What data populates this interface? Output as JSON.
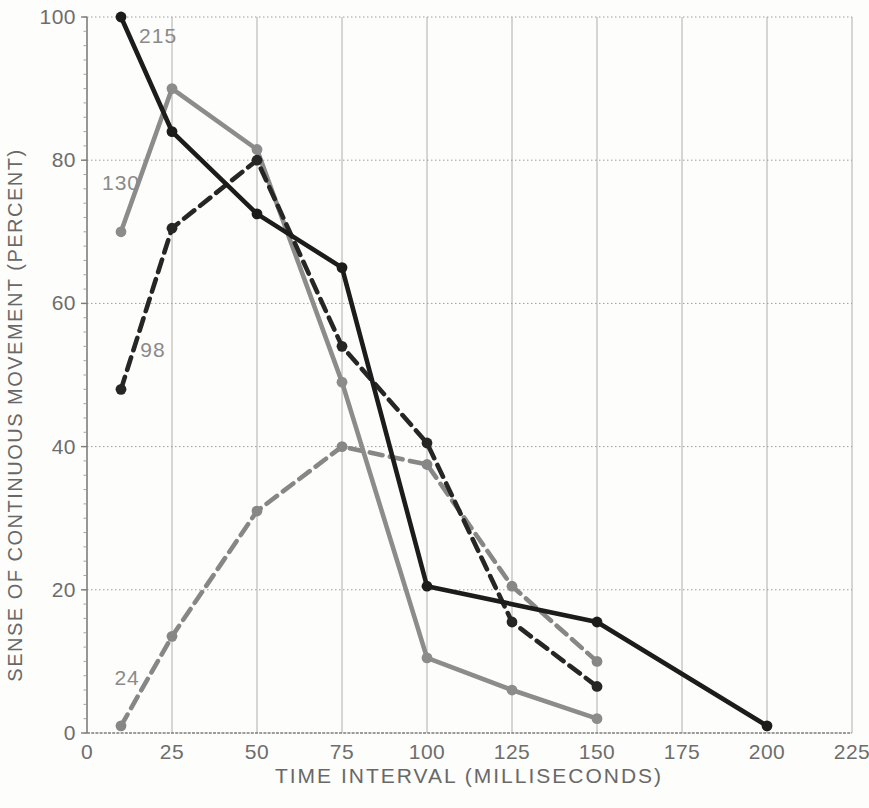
{
  "figure": {
    "background_color": "#fdfdfb",
    "axis_color": "#7d7d7d",
    "grid_vertical_color": "#aeaeae",
    "grid_horizontal_color": "#9c9c9c",
    "tick_label_color": "#6d6d6d",
    "title_color": "#686868",
    "series_label_color": "#8a8a8a"
  },
  "chart_data": {
    "type": "line",
    "title": "",
    "xlabel": "TIME INTERVAL (MILLISECONDS)",
    "ylabel": "SENSE OF CONTINUOUS MOVEMENT (PERCENT)",
    "xlim": [
      0,
      225
    ],
    "ylim": [
      0,
      100
    ],
    "xticks": [
      0,
      25,
      50,
      75,
      100,
      125,
      150,
      175,
      200,
      225
    ],
    "yticks": [
      0,
      20,
      40,
      60,
      80,
      100
    ],
    "grid": true,
    "legend_position": "inline-labels",
    "series": [
      {
        "name": "24",
        "style": "dashed",
        "color": "#878787",
        "x": [
          10,
          25,
          50,
          75,
          100,
          125,
          150
        ],
        "y": [
          1,
          13.5,
          31,
          40,
          37.5,
          20.5,
          10
        ],
        "label": "24",
        "label_at": {
          "x": 11.8,
          "y": 7.7
        }
      },
      {
        "name": "130",
        "style": "solid",
        "color": "#8c8c8c",
        "x": [
          10,
          25,
          50,
          75,
          100,
          125,
          150
        ],
        "y": [
          70,
          90,
          81.5,
          49,
          10.5,
          6,
          2
        ],
        "label": "130",
        "label_at": {
          "x": 10,
          "y": 76.8
        }
      },
      {
        "name": "98",
        "style": "dashed",
        "color": "#262626",
        "x": [
          10,
          25,
          50,
          75,
          100,
          125,
          150
        ],
        "y": [
          48,
          70.5,
          80,
          54,
          40.5,
          15.5,
          6.5
        ],
        "label": "98",
        "label_at": {
          "x": 19.4,
          "y": 53.5
        }
      },
      {
        "name": "215",
        "style": "solid",
        "color": "#1c1c1c",
        "x": [
          10,
          25,
          50,
          75,
          100,
          150,
          200
        ],
        "y": [
          100,
          84,
          72.5,
          65,
          20.5,
          15.5,
          1
        ],
        "label": "215",
        "label_at": {
          "x": 20.9,
          "y": 97.4
        }
      }
    ]
  }
}
